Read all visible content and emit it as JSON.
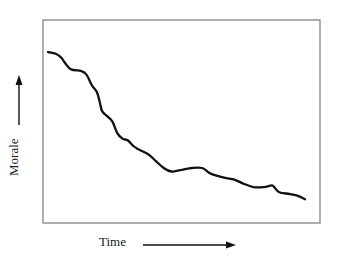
{
  "chart_data": {
    "type": "line",
    "title": "",
    "xlabel": "Time",
    "ylabel": "Morale",
    "x_arrow": "right-arrow",
    "y_arrow": "up-arrow",
    "grid": false,
    "legend": null,
    "ticks": false,
    "x": [
      0,
      3,
      5,
      7,
      9,
      13,
      15,
      17,
      19,
      20,
      21,
      23,
      25,
      27,
      29,
      31,
      33,
      35,
      39,
      42,
      45,
      48,
      52,
      56,
      60,
      63,
      67,
      70,
      73,
      76,
      80,
      84,
      87,
      88,
      90,
      94,
      97,
      100
    ],
    "values": [
      93,
      92,
      90,
      86,
      83,
      82,
      80,
      74,
      70,
      65,
      59,
      56,
      53,
      46,
      43,
      42,
      39,
      37,
      34,
      30,
      26,
      24,
      25,
      26,
      26,
      23,
      21,
      20,
      19,
      17,
      15,
      15,
      16,
      15,
      12,
      11,
      10,
      8
    ],
    "xlim": [
      0,
      100
    ],
    "ylim": [
      0,
      100
    ],
    "color": "#111111"
  }
}
